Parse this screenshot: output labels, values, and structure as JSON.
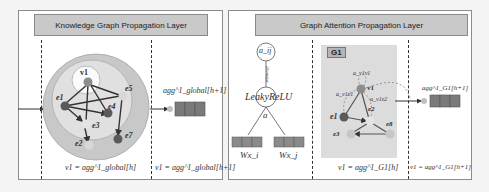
{
  "left_panel": {
    "title": "Knowledge Graph Propagation Layer",
    "nodes": [
      {
        "id": "v1",
        "label": "v1",
        "color": "#8c8c8c"
      },
      {
        "id": "e1",
        "label": "e1",
        "color": "#5a5a5a"
      },
      {
        "id": "e2",
        "label": "e2",
        "color": "#d8d8d8"
      },
      {
        "id": "e3",
        "label": "e3",
        "color": "#d8d8d8"
      },
      {
        "id": "e4",
        "label": "e4",
        "color": "#5a5a5a"
      },
      {
        "id": "e5",
        "label": "e5",
        "color": "#d8d8d8"
      },
      {
        "id": "e7",
        "label": "e7",
        "color": "#5a5a5a"
      }
    ],
    "output_label": "agg^1_global[h+1]",
    "bottom_left_eq": "v1 = agg^1_global[h]",
    "bottom_right_eq": "v1 = agg^1_global[h+1]"
  },
  "right_panel": {
    "title": "Graph Attention Propagation Layer",
    "attention_node": "a_ij",
    "softmax_label": "softmax(j)",
    "activation": "LeakyReLU",
    "a_label": "a",
    "input_left": "Wx_i",
    "input_right": "Wx_j",
    "graph_tag": "G1",
    "graph_nodes": [
      {
        "id": "v1",
        "label": "v1"
      },
      {
        "id": "e1",
        "label": "e1"
      },
      {
        "id": "e2",
        "label": "e2"
      },
      {
        "id": "e3",
        "label": "e3"
      },
      {
        "id": "e8",
        "label": "e8"
      }
    ],
    "attention_labels": [
      "a_v1v1",
      "a_v1e1",
      "a_v1e2"
    ],
    "output_label": "agg^1_G1[h+1]",
    "bottom_left_eq": "v1 = agg^1_G1[h]",
    "bottom_right_eq": "v1 = agg^1_G1[h+1]"
  },
  "colors": {
    "panel_bg": "#ffffff",
    "title_bg": "#c9c9c9",
    "outer_circle": "#c8c8c8",
    "inner_circle": "#e0e0e0",
    "vector_cell": "#7a7a7a",
    "g_box": "#dcdcdc"
  }
}
